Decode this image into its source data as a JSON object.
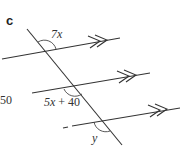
{
  "part_label": "c",
  "side_number": "50",
  "angles": [
    {
      "label": "7x",
      "position": "top-left of first intersection"
    },
    {
      "label": "5x + 40",
      "position": "bottom-left of second intersection"
    },
    {
      "label": "y",
      "position": "bottom of third intersection"
    }
  ],
  "parallel_marker": ">>",
  "colors": {
    "line": "#333333",
    "text": "#333333"
  }
}
